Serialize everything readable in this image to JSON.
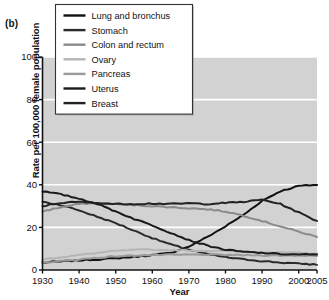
{
  "figure": {
    "panel_label": "(b)",
    "xlabel": "Year",
    "ylabel": "Rate per 100,000 female population"
  },
  "axis": {
    "y_ticks": [
      "0",
      "20",
      "40",
      "60",
      "80",
      "100"
    ],
    "x_ticks": [
      "1930",
      "1940",
      "1950",
      "1960",
      "1970",
      "1980",
      "1990",
      "2000",
      "2005"
    ]
  },
  "legend": {
    "items": [
      {
        "label": "Lung and bronchus",
        "color": "#111111"
      },
      {
        "label": "Stomach",
        "color": "#2b2b2b"
      },
      {
        "label": "Colon and rectum",
        "color": "#8a8a8a"
      },
      {
        "label": "Ovary",
        "color": "#b5b5b5"
      },
      {
        "label": "Pancreas",
        "color": "#9a9a9a"
      },
      {
        "label": "Uterus",
        "color": "#1a1a1a"
      },
      {
        "label": "Breast",
        "color": "#222222"
      }
    ]
  },
  "colors": {
    "plot_background": "#d2d2d2",
    "gridline": "#ffffff",
    "axis": "#111111",
    "legend_background": "#ffffff",
    "legend_border": "#333333"
  },
  "chart_data": {
    "type": "line",
    "title": "",
    "xlabel": "Year",
    "ylabel": "Rate per 100,000 female population",
    "xlim": [
      1930,
      2005
    ],
    "ylim": [
      0,
      100
    ],
    "grid": true,
    "legend_position": "top-left-inside",
    "x": [
      1930,
      1935,
      1940,
      1945,
      1950,
      1955,
      1960,
      1965,
      1970,
      1975,
      1980,
      1985,
      1990,
      1995,
      2000,
      2005
    ],
    "series": [
      {
        "name": "Lung and bronchus",
        "color": "#111111",
        "values": [
          3.5,
          4.0,
          4.5,
          5.0,
          5.5,
          6.2,
          7.0,
          8.0,
          11.0,
          15.5,
          20.5,
          26.0,
          32.5,
          37.0,
          39.5,
          40.0
        ]
      },
      {
        "name": "Stomach",
        "color": "#2b2b2b",
        "values": [
          32.0,
          30.5,
          28.0,
          25.0,
          22.0,
          18.5,
          15.0,
          12.0,
          9.5,
          7.5,
          6.0,
          5.0,
          4.2,
          3.5,
          3.0,
          2.5
        ]
      },
      {
        "name": "Colon and rectum",
        "color": "#8a8a8a",
        "values": [
          27.5,
          29.5,
          31.0,
          31.5,
          31.0,
          30.5,
          30.0,
          29.5,
          29.0,
          28.5,
          27.5,
          25.5,
          23.0,
          20.5,
          18.0,
          15.5
        ]
      },
      {
        "name": "Ovary",
        "color": "#b5b5b5",
        "values": [
          5.0,
          6.0,
          7.0,
          8.0,
          9.0,
          9.5,
          9.5,
          9.3,
          9.2,
          9.0,
          8.8,
          8.6,
          8.4,
          8.2,
          8.0,
          7.8
        ]
      },
      {
        "name": "Pancreas",
        "color": "#9a9a9a",
        "values": [
          3.5,
          4.2,
          5.0,
          5.8,
          6.4,
          6.8,
          7.0,
          7.1,
          7.2,
          7.2,
          7.1,
          7.0,
          6.9,
          6.8,
          6.8,
          6.8
        ]
      },
      {
        "name": "Uterus",
        "color": "#1a1a1a",
        "values": [
          37.0,
          35.5,
          33.5,
          31.0,
          27.5,
          24.0,
          21.0,
          17.5,
          14.0,
          11.5,
          9.5,
          8.5,
          8.0,
          7.5,
          7.3,
          7.2
        ]
      },
      {
        "name": "Breast",
        "color": "#222222",
        "values": [
          30.0,
          31.5,
          32.0,
          31.5,
          31.0,
          31.0,
          31.2,
          31.0,
          31.3,
          31.0,
          31.5,
          32.0,
          33.0,
          31.0,
          27.0,
          23.0
        ]
      }
    ]
  }
}
